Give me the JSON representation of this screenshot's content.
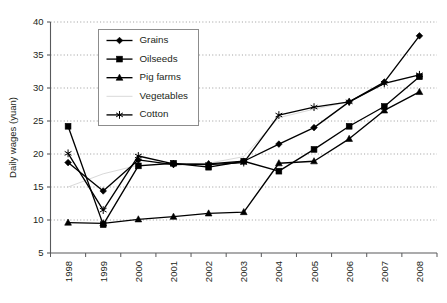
{
  "chart_data": {
    "type": "line",
    "title": "",
    "xlabel": "",
    "ylabel": "Daily wages (yuan)",
    "categories": [
      "1998",
      "1999",
      "2000",
      "2001",
      "2002",
      "2003",
      "2004",
      "2005",
      "2006",
      "2007",
      "2008"
    ],
    "ylim": [
      5,
      40
    ],
    "yticks": [
      5,
      10,
      15,
      20,
      25,
      30,
      35,
      40
    ],
    "grid": "horizontal-dotted",
    "legend_position": "upper-left-inside",
    "series": [
      {
        "name": "Grains",
        "marker": "diamond",
        "color": "#000000",
        "values": [
          18.7,
          14.4,
          19.1,
          18.4,
          18.5,
          18.9,
          21.5,
          24.0,
          27.9,
          30.9,
          37.9
        ]
      },
      {
        "name": "Oilseeds",
        "marker": "square",
        "color": "#000000",
        "values": [
          24.2,
          9.3,
          18.2,
          18.6,
          18.0,
          18.9,
          17.4,
          20.7,
          24.2,
          27.2,
          31.7
        ]
      },
      {
        "name": "Pig farms",
        "marker": "triangle",
        "color": "#000000",
        "values": [
          9.6,
          9.5,
          10.1,
          10.5,
          11.0,
          11.2,
          18.6,
          18.9,
          22.3,
          26.6,
          29.4
        ]
      },
      {
        "name": "Vegetables",
        "marker": "none",
        "color": "#d9d9d9",
        "values": [
          15.0,
          17.0,
          18.3,
          18.5,
          18.6,
          19.6,
          25.5,
          26.8,
          27.9,
          30.6,
          32.0
        ]
      },
      {
        "name": "Cotton",
        "marker": "asterisk",
        "color": "#000000",
        "values": [
          20.1,
          11.5,
          19.7,
          18.5,
          18.4,
          18.7,
          25.9,
          27.1,
          27.9,
          30.7,
          32.0
        ]
      }
    ]
  }
}
